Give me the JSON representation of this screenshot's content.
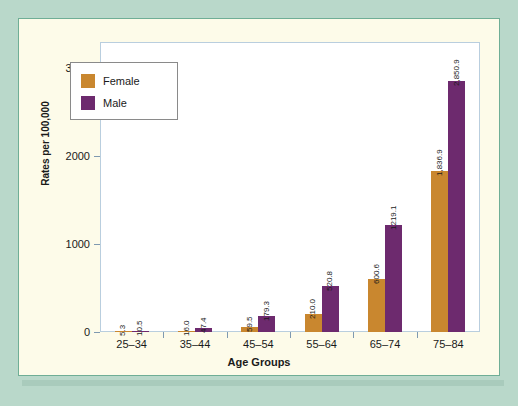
{
  "chart_data": {
    "type": "bar",
    "title": "",
    "subtitle": "",
    "xlabel": "Age Groups",
    "ylabel": "Rates per 100,000",
    "categories": [
      "25–34",
      "35–44",
      "45–54",
      "55–64",
      "65–74",
      "75–84"
    ],
    "series": [
      {
        "name": "Female",
        "color": "#c9872f",
        "values": [
          5.3,
          16.0,
          59.5,
          210.0,
          600.6,
          1836.9
        ],
        "labels": [
          "5.3",
          "16.0",
          "59.5",
          "210.0",
          "600.6",
          "1,836.9"
        ]
      },
      {
        "name": "Male",
        "color": "#6d2a6e",
        "values": [
          10.5,
          47.4,
          179.3,
          520.8,
          1219.1,
          2850.9
        ],
        "labels": [
          "10.5",
          "47.4",
          "179.3",
          "520.8",
          "1219.1",
          "2,850.9"
        ]
      }
    ],
    "ylim": [
      0,
      3300
    ],
    "yticks": [
      0,
      1000,
      2000,
      3000
    ],
    "ytick_labels": [
      "0",
      "1000",
      "2000",
      "3000"
    ],
    "grid": false,
    "legend_position": "upper left"
  },
  "legend": {
    "entries": [
      {
        "label": "Female",
        "color": "#c9872f"
      },
      {
        "label": "Male",
        "color": "#6d2a6e"
      }
    ]
  },
  "colors": {
    "frame_outer": "#b9d8ca",
    "frame_inner": "#fdfbe9",
    "plot_background": "#ffffff",
    "female": "#c9872f",
    "male": "#6d2a6e",
    "axis": "#7f99b0"
  }
}
